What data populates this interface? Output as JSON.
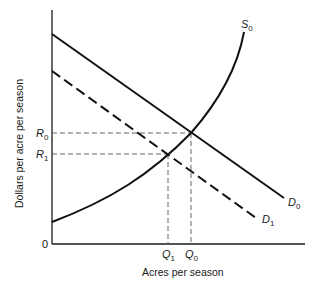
{
  "diagram": {
    "type": "supply-demand",
    "x_axis_label": "Acres per season",
    "y_axis_label": "Dollars per acre per season",
    "origin_label": "0",
    "curves": [
      {
        "id": "D0",
        "name": "D",
        "sub": "0",
        "style": "solid",
        "kind": "demand"
      },
      {
        "id": "D1",
        "name": "D",
        "sub": "1",
        "style": "dashed",
        "kind": "demand"
      },
      {
        "id": "S0",
        "name": "S",
        "sub": "0",
        "style": "solid",
        "kind": "supply"
      }
    ],
    "price_markers": [
      {
        "id": "R0",
        "name": "R",
        "sub": "0"
      },
      {
        "id": "R1",
        "name": "R",
        "sub": "1"
      }
    ],
    "quantity_markers": [
      {
        "id": "Q1",
        "name": "Q",
        "sub": "1"
      },
      {
        "id": "Q0",
        "name": "Q",
        "sub": "0"
      }
    ],
    "equilibria": [
      {
        "demand": "D0",
        "supply": "S0",
        "price": "R0",
        "quantity": "Q0"
      },
      {
        "demand": "D1",
        "supply": "S0",
        "price": "R1",
        "quantity": "Q1"
      }
    ]
  }
}
